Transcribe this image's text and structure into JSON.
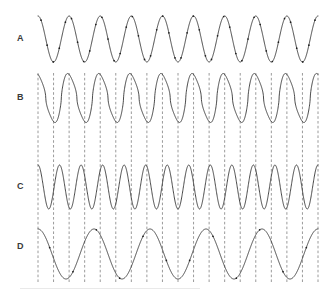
{
  "figure": {
    "width": 328,
    "height": 293,
    "background_color": "#ffffff",
    "trace_color": "#2b2b2b",
    "guide_color": "#8e8e8e",
    "marker_color": "#1e1e1e",
    "label_color": "#3a3a3a"
  },
  "labels": {
    "a": "A",
    "b": "B",
    "c": "C",
    "d": "D"
  },
  "chart_data": {
    "type": "line",
    "title": "",
    "xlabel": "",
    "ylabel": "",
    "grid": false,
    "legend": "none",
    "x_range": [
      38,
      318
    ],
    "series": [
      {
        "name": "A",
        "label": "A",
        "row_index": 0,
        "waveform": "sine",
        "cycles": 9,
        "phase_deg": 90,
        "baseline_y": 39,
        "amplitude_px": 23,
        "top_y": 16,
        "bottom_y": 62,
        "has_markers": true,
        "marker_count": 46,
        "has_guide_lines": false
      },
      {
        "name": "B",
        "label": "B",
        "row_index": 1,
        "waveform": "sharp-peaked-sine",
        "cycles": 9,
        "phase_deg": 90,
        "baseline_y": 98,
        "amplitude_px": 25,
        "top_y": 73,
        "bottom_y": 123,
        "peak_sharpness": 1.55,
        "has_markers": false,
        "has_guide_lines": true,
        "guide_extends_to_row": 3
      },
      {
        "name": "C",
        "label": "C",
        "row_index": 2,
        "waveform": "sine",
        "cycles": 13,
        "phase_deg": 90,
        "baseline_y": 187,
        "amplitude_px": 22,
        "top_y": 165,
        "bottom_y": 209,
        "has_markers": false,
        "has_guide_lines": true
      },
      {
        "name": "D",
        "label": "D",
        "row_index": 3,
        "waveform": "sine",
        "cycles": 5,
        "phase_deg": 90,
        "baseline_y": 254,
        "amplitude_px": 25,
        "top_y": 229,
        "bottom_y": 279,
        "has_markers": true,
        "marker_count": 12,
        "has_guide_lines": true
      }
    ],
    "guide_lines": {
      "count": 19,
      "anchored_to_series": "B",
      "anchor_points": "alternating peaks and troughs",
      "y_top": 73,
      "y_bottom": 283,
      "dash_pattern": "2.6 2.2"
    },
    "annotations": []
  },
  "label_positions": {
    "a": {
      "x": 17,
      "y": 34
    },
    "b": {
      "x": 17,
      "y": 93
    },
    "c": {
      "x": 17,
      "y": 182
    },
    "d": {
      "x": 17,
      "y": 242
    }
  }
}
